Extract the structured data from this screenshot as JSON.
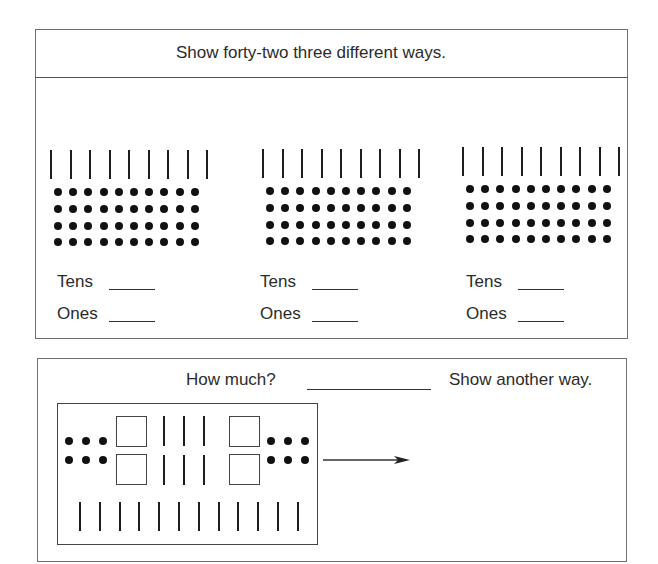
{
  "top_panel": {
    "title": "Show forty-two three different ways.",
    "groups": [
      {
        "tens_sticks": 9,
        "ones_dot_rows": 4,
        "ones_dot_cols": 10,
        "tens_label": "Tens",
        "ones_label": "Ones",
        "tens_answer": "",
        "ones_answer": ""
      },
      {
        "tens_sticks": 9,
        "ones_dot_rows": 4,
        "ones_dot_cols": 10,
        "tens_label": "Tens",
        "ones_label": "Ones",
        "tens_answer": "",
        "ones_answer": ""
      },
      {
        "tens_sticks": 9,
        "ones_dot_rows": 4,
        "ones_dot_cols": 10,
        "tens_label": "Tens",
        "ones_label": "Ones",
        "tens_answer": "",
        "ones_answer": ""
      }
    ]
  },
  "bottom_panel": {
    "question": "How much?",
    "answer": "",
    "instruction": "Show another way.",
    "model": {
      "hundreds_squares": 4,
      "tens_sticks_top": 6,
      "tens_sticks_bottom": 12,
      "ones_dots": 12
    },
    "arrow": "arrow-right"
  },
  "colors": {
    "ink": "#111111",
    "border": "#6f6f6f",
    "background": "#ffffff"
  }
}
